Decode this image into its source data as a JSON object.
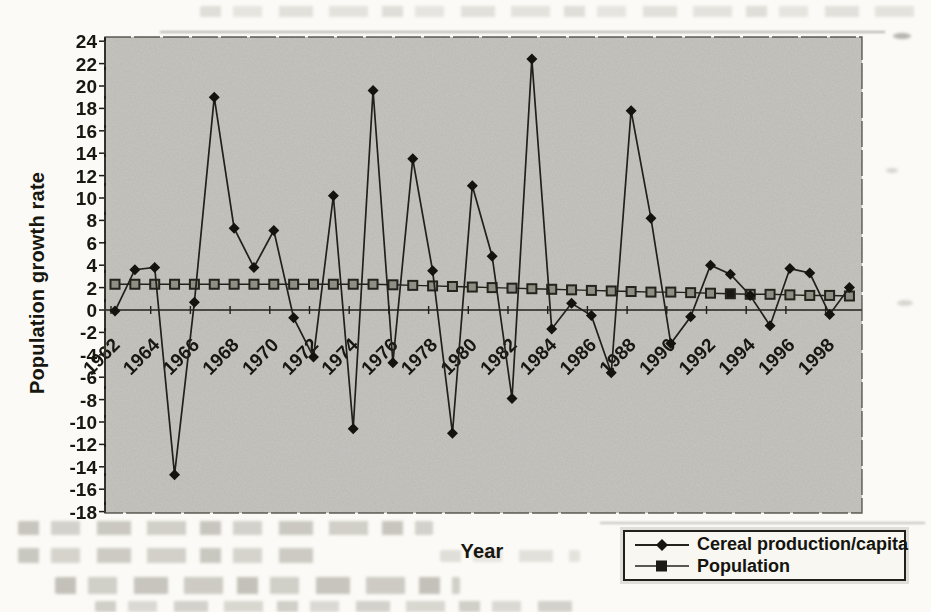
{
  "chart_data": {
    "type": "line",
    "title": "",
    "xlabel": "Year",
    "ylabel": "Population growth rate",
    "x": [
      1962,
      1963,
      1964,
      1965,
      1966,
      1967,
      1968,
      1969,
      1970,
      1971,
      1972,
      1973,
      1974,
      1975,
      1976,
      1977,
      1978,
      1979,
      1980,
      1981,
      1982,
      1983,
      1984,
      1985,
      1986,
      1987,
      1988,
      1989,
      1990,
      1991,
      1992,
      1993,
      1994,
      1995,
      1996,
      1997,
      1998,
      1999
    ],
    "x_tick_labels": [
      "1962",
      "1964",
      "1966",
      "1968",
      "1970",
      "1972",
      "1974",
      "1976",
      "1978",
      "1980",
      "1982",
      "1984",
      "1986",
      "1988",
      "1990",
      "1992",
      "1994",
      "1996",
      "1998"
    ],
    "y_tick_labels": [
      "24",
      "22",
      "20",
      "18",
      "16",
      "14",
      "12",
      "10",
      "8",
      "6",
      "4",
      "2",
      "0",
      "-2",
      "-4",
      "-6",
      "-8",
      "-10",
      "-12",
      "-14",
      "-16",
      "-18"
    ],
    "ylim": [
      -18,
      24
    ],
    "ytick_step": 2,
    "grid": false,
    "legend_position": "bottom-right",
    "plot_bg_color": "#c6c5c0",
    "line_color": "#23221c",
    "series": [
      {
        "name": "Cereal production/capita",
        "marker": "diamond",
        "marker_fill": "#16150f",
        "values": [
          -0.1,
          3.6,
          3.8,
          -14.7,
          0.7,
          19.0,
          7.3,
          3.8,
          7.1,
          -0.7,
          -4.2,
          10.2,
          -10.6,
          19.6,
          -4.7,
          13.5,
          3.5,
          -11.0,
          11.1,
          4.8,
          -7.9,
          22.4,
          -1.7,
          0.6,
          -0.5,
          -5.6,
          17.8,
          8.2,
          -3.0,
          -0.6,
          4.0,
          3.2,
          1.3,
          -1.4,
          3.7,
          3.3,
          -0.4,
          2.0
        ]
      },
      {
        "name": "Population",
        "marker": "square",
        "marker_fill": "#8f8f85",
        "dark_marker_year": 1993,
        "values": [
          2.3,
          2.3,
          2.3,
          2.3,
          2.3,
          2.3,
          2.3,
          2.3,
          2.3,
          2.3,
          2.3,
          2.3,
          2.3,
          2.3,
          2.25,
          2.2,
          2.15,
          2.1,
          2.05,
          2.0,
          1.95,
          1.9,
          1.85,
          1.8,
          1.75,
          1.7,
          1.65,
          1.6,
          1.6,
          1.55,
          1.5,
          1.45,
          1.4,
          1.4,
          1.35,
          1.3,
          1.3,
          1.25
        ]
      }
    ]
  }
}
